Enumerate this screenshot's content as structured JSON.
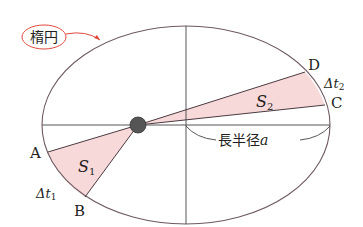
{
  "diagram": {
    "title_label": "楕円",
    "major_axis_label": "長半径",
    "major_axis_var": "a",
    "points": {
      "A": "A",
      "B": "B",
      "C": "C",
      "D": "D"
    },
    "areas": {
      "s1_base": "S",
      "s1_sub": "1",
      "s2_base": "S",
      "s2_sub": "2"
    },
    "times": {
      "t1_prefix": "Δt",
      "t1_sub": "1",
      "t2_prefix": "Δt",
      "t2_sub": "2"
    },
    "colors": {
      "sector_fill": "#f7d9da",
      "ellipse_stroke": "#6e5a60",
      "callout_red": "#e0483f",
      "sun_fill": "#555555"
    }
  }
}
